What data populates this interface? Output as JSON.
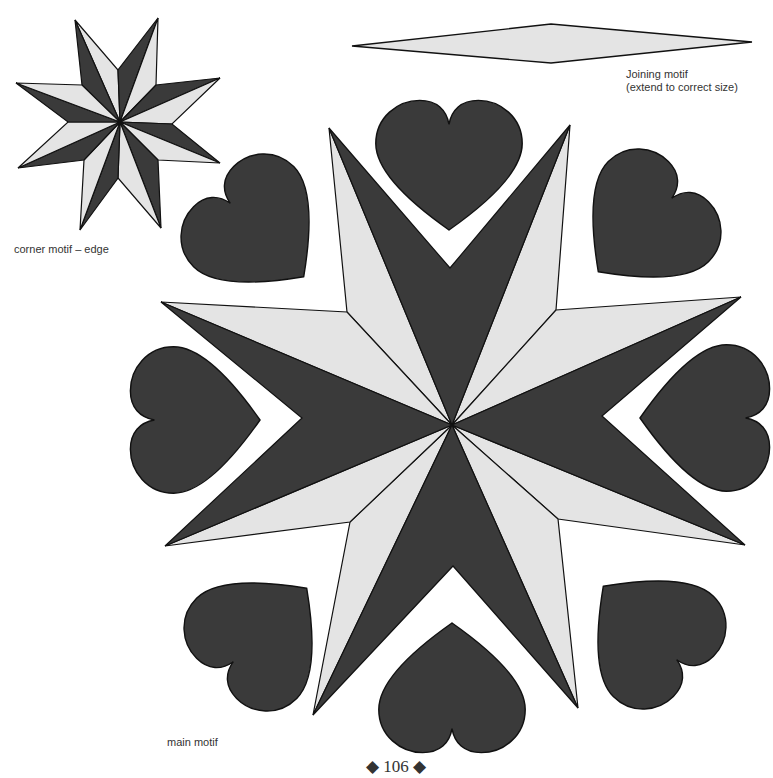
{
  "labels": {
    "corner_motif": "corner motif – edge",
    "joining_motif_line1": "Joining motif",
    "joining_motif_line2": "(extend to correct size)",
    "main_motif": "main motif"
  },
  "page_number": "◆ 106 ◆",
  "colors": {
    "dark_fill": "#3a3a3a",
    "light_fill": "#e4e4e4",
    "outline": "#111111",
    "background": "#ffffff"
  },
  "motifs": [
    {
      "name": "corner-motif",
      "type": "eight-point star",
      "position": "top-left"
    },
    {
      "name": "joining-motif",
      "type": "elongated diamond",
      "position": "top-right"
    },
    {
      "name": "main-motif",
      "type": "eight-point cross star with eight hearts",
      "position": "center"
    }
  ]
}
